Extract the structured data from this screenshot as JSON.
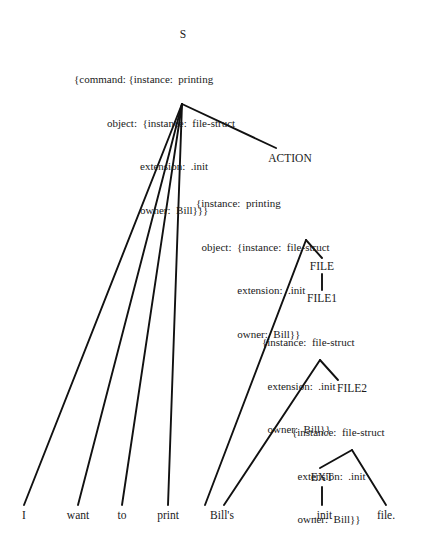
{
  "diagram": {
    "background_color": "#ffffff",
    "line_color": "#111111",
    "text_color": "#1a1a1a"
  },
  "nodes": {
    "s": {
      "label": "S",
      "features": [
        "{command: {instance:  printing",
        "            object:  {instance:  file-struct",
        "                        extension:  .init",
        "                        owner:  Bill}}}"
      ]
    },
    "action": {
      "label": "ACTION",
      "features": [
        "{instance:  printing",
        "  object:  {instance:  file-struct",
        "               extension:  .init",
        "               owner:  Bill}}"
      ]
    },
    "file": {
      "label": "FILE",
      "features": []
    },
    "file1": {
      "label": "FILE1",
      "features": [
        "{instance:  file-struct",
        "  extension:  .init",
        "  owner:  Bill}}"
      ]
    },
    "file2": {
      "label": "FILE2",
      "features": [
        "{instance:  file-struct",
        "  extension:  .init",
        "  owner:  Bill}}"
      ]
    },
    "ext": {
      "label": "EXT",
      "features": []
    }
  },
  "leaves": [
    {
      "id": "leaf-i",
      "text": "I"
    },
    {
      "id": "leaf-want",
      "text": "want"
    },
    {
      "id": "leaf-to",
      "text": "to"
    },
    {
      "id": "leaf-print",
      "text": "print"
    },
    {
      "id": "leaf-bills",
      "text": "Bill's"
    },
    {
      "id": "leaf-init",
      "text": ".init"
    },
    {
      "id": "leaf-file",
      "text": "file."
    }
  ],
  "sentence": "I want to print Bill's .init file."
}
